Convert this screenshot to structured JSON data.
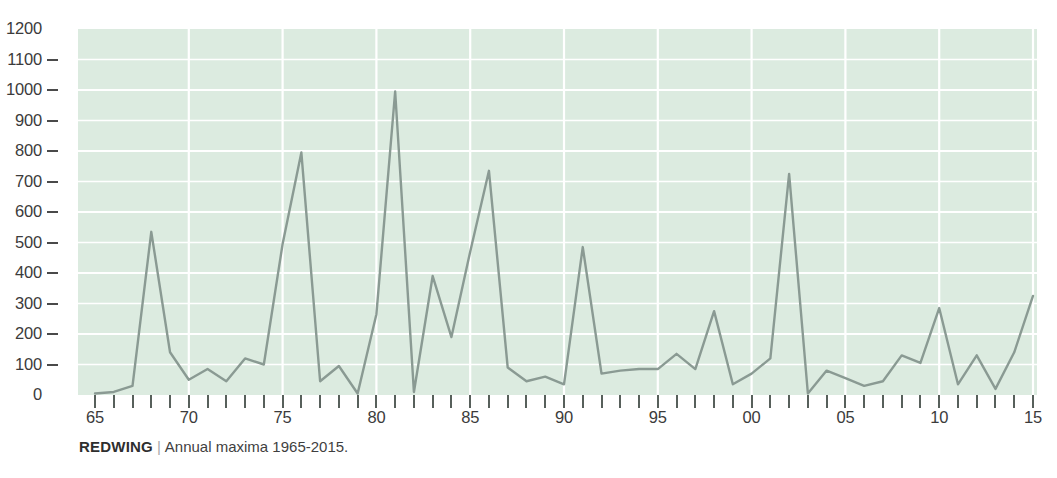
{
  "caption": {
    "source": "REDWING",
    "divider": "|",
    "description": "Annual maxima 1965-2015."
  },
  "colors": {
    "plot_background": "#dcebe0",
    "gridline": "#ffffff",
    "line": "#8a9a93",
    "axis_text": "#3b3b3b",
    "tick": "#57605b"
  },
  "chart_data": {
    "type": "line",
    "title": "",
    "subtitle": "",
    "xlabel": "",
    "ylabel": "",
    "xlim": [
      1965,
      2015
    ],
    "ylim": [
      0,
      1200
    ],
    "ytick_step": 100,
    "grid": true,
    "legend": "none",
    "y_ticks": [
      0,
      100,
      200,
      300,
      400,
      500,
      600,
      700,
      800,
      900,
      1000,
      1100,
      1200
    ],
    "y_tick_labels": [
      "0",
      "100",
      "200",
      "300",
      "400",
      "500",
      "600",
      "700",
      "800",
      "900",
      "1000",
      "1100",
      "1200"
    ],
    "x_tick_years": [
      1965,
      1966,
      1967,
      1968,
      1969,
      1970,
      1971,
      1972,
      1973,
      1974,
      1975,
      1976,
      1977,
      1978,
      1979,
      1980,
      1981,
      1982,
      1983,
      1984,
      1985,
      1986,
      1987,
      1988,
      1989,
      1990,
      1991,
      1992,
      1993,
      1994,
      1995,
      1996,
      1997,
      1998,
      1999,
      2000,
      2001,
      2002,
      2003,
      2004,
      2005,
      2006,
      2007,
      2008,
      2009,
      2010,
      2011,
      2012,
      2013,
      2014,
      2015
    ],
    "x_labeled_years": [
      1965,
      1970,
      1975,
      1980,
      1985,
      1990,
      1995,
      2000,
      2005,
      2010,
      2015
    ],
    "x_tick_labels": [
      "65",
      "70",
      "75",
      "80",
      "85",
      "90",
      "95",
      "00",
      "05",
      "10",
      "15"
    ],
    "series": [
      {
        "name": "Annual maxima",
        "x": [
          1965,
          1966,
          1967,
          1968,
          1969,
          1970,
          1971,
          1972,
          1973,
          1974,
          1975,
          1976,
          1977,
          1978,
          1979,
          1980,
          1981,
          1982,
          1983,
          1984,
          1985,
          1986,
          1987,
          1988,
          1989,
          1990,
          1991,
          1992,
          1993,
          1994,
          1995,
          1996,
          1997,
          1998,
          1999,
          2000,
          2001,
          2002,
          2003,
          2004,
          2005,
          2006,
          2007,
          2008,
          2009,
          2010,
          2011,
          2012,
          2013,
          2014,
          2015
        ],
        "values": [
          5,
          10,
          30,
          535,
          140,
          50,
          85,
          45,
          120,
          100,
          495,
          795,
          45,
          95,
          5,
          265,
          995,
          10,
          390,
          190,
          470,
          735,
          90,
          45,
          60,
          35,
          485,
          70,
          80,
          85,
          85,
          135,
          85,
          275,
          35,
          70,
          120,
          725,
          5,
          80,
          55,
          30,
          45,
          130,
          105,
          285,
          35,
          130,
          20,
          140,
          325
        ]
      }
    ]
  }
}
